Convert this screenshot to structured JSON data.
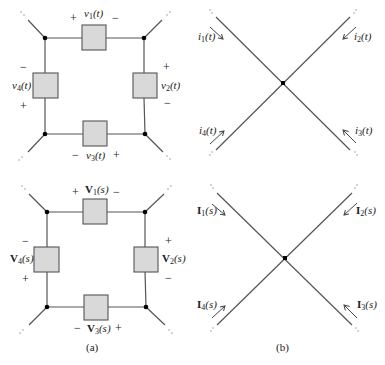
{
  "panels": {
    "a": {
      "caption": "(a)",
      "time_domain": {
        "elements": [
          {
            "id": 1,
            "label_pre": "v",
            "sub": "1",
            "arg": "(t)",
            "plus": "+",
            "minus": "−"
          },
          {
            "id": 2,
            "label_pre": "v",
            "sub": "2",
            "arg": "(t)",
            "plus": "+",
            "minus": "−"
          },
          {
            "id": 3,
            "label_pre": "v",
            "sub": "3",
            "arg": "(t)",
            "plus": "+",
            "minus": "−"
          },
          {
            "id": 4,
            "label_pre": "v",
            "sub": "4",
            "arg": "(t)",
            "plus": "+",
            "minus": "−"
          }
        ]
      },
      "s_domain": {
        "elements": [
          {
            "id": 1,
            "label_pre": "V",
            "sub": "1",
            "arg": "(s)",
            "plus": "+",
            "minus": "−"
          },
          {
            "id": 2,
            "label_pre": "V",
            "sub": "2",
            "arg": "(s)",
            "plus": "+",
            "minus": "−"
          },
          {
            "id": 3,
            "label_pre": "V",
            "sub": "3",
            "arg": "(s)",
            "plus": "+",
            "minus": "−"
          },
          {
            "id": 4,
            "label_pre": "V",
            "sub": "4",
            "arg": "(s)",
            "plus": "+",
            "minus": "−"
          }
        ]
      }
    },
    "b": {
      "caption": "(b)",
      "time_domain": {
        "currents": [
          {
            "id": 1,
            "label_pre": "i",
            "sub": "1",
            "arg": "(t)"
          },
          {
            "id": 2,
            "label_pre": "i",
            "sub": "2",
            "arg": "(t)"
          },
          {
            "id": 3,
            "label_pre": "i",
            "sub": "3",
            "arg": "(t)"
          },
          {
            "id": 4,
            "label_pre": "i",
            "sub": "4",
            "arg": "(t)"
          }
        ]
      },
      "s_domain": {
        "currents": [
          {
            "id": 1,
            "label_pre": "I",
            "sub": "1",
            "arg": "(s)"
          },
          {
            "id": 2,
            "label_pre": "I",
            "sub": "2",
            "arg": "(s)"
          },
          {
            "id": 3,
            "label_pre": "I",
            "sub": "3",
            "arg": "(s)"
          },
          {
            "id": 4,
            "label_pre": "I",
            "sub": "4",
            "arg": "(s)"
          }
        ]
      }
    }
  },
  "colors": {
    "wire": "#555555",
    "box_fill": "#d9d9d9",
    "box_stroke": "#555555",
    "node": "#000000"
  }
}
